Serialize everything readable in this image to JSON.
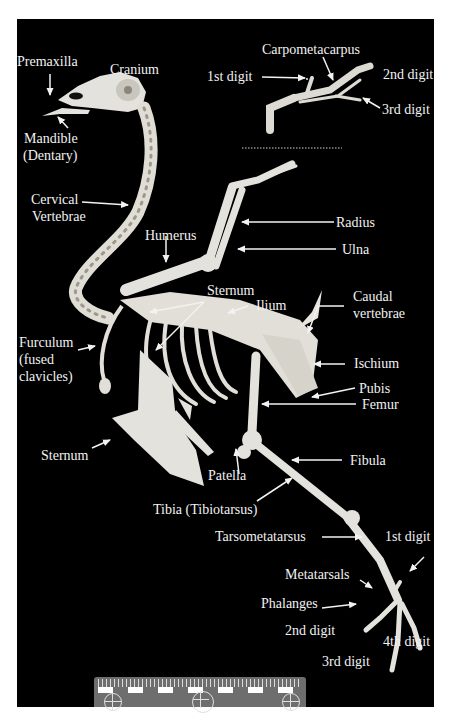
{
  "figure": {
    "background_color": "#000000",
    "label_color": "#f2f2f2",
    "bone_color": "#e6e6e0"
  },
  "wing_inset": {
    "labels": {
      "carpometacarpus": "Carpometacarpus",
      "first_digit": "1st digit",
      "second_digit": "2nd digit",
      "third_digit": "3rd digit"
    },
    "separator": "dotted-line"
  },
  "labels": {
    "premaxilla": "Premaxilla",
    "cranium": "Cranium",
    "mandible_line1": "Mandible",
    "mandible_line2": "(Dentary)",
    "cervical_line1": "Cervical",
    "cervical_line2": "Vertebrae",
    "humerus": "Humerus",
    "radius": "Radius",
    "ulna": "Ulna",
    "sternum_upper": "Sternum",
    "ilium": "Ilium",
    "caudal_line1": "Caudal",
    "caudal_line2": "vertebrae",
    "furculum_line1": "Furculum",
    "furculum_line2": "(fused",
    "furculum_line3": "clavicles)",
    "ischium": "Ischium",
    "pubis": "Pubis",
    "femur": "Femur",
    "sternum_lower": "Sternum",
    "patella": "Patella",
    "fibula": "Fibula",
    "tibia": "Tibia (Tibiotarsus)",
    "tarsometatarsus": "Tarsometatarsus",
    "foot_first_digit": "1st digit",
    "metatarsals": "Metatarsals",
    "phalanges": "Phalanges",
    "foot_second_digit": "2nd digit",
    "foot_third_digit": "3rd digit",
    "foot_fourth_digit": "4th digit"
  },
  "scale_bar": {
    "type": "ruler",
    "segments": 12
  }
}
